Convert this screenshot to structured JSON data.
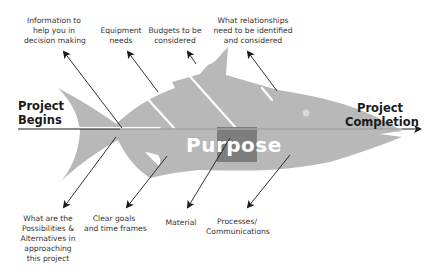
{
  "diagram": {
    "type": "fishbone",
    "center_label": "Purpose",
    "start": [
      "Project",
      "Begins"
    ],
    "end": [
      "Project",
      "Completion"
    ],
    "top_causes": [
      {
        "lines": [
          "Information to",
          "help you in",
          "decision making"
        ]
      },
      {
        "lines": [
          "Equipment",
          "needs"
        ]
      },
      {
        "lines": [
          "Budgets to be",
          "considered"
        ]
      },
      {
        "lines": [
          "What relationships",
          "need to be identified",
          "and considered"
        ]
      }
    ],
    "bottom_causes": [
      {
        "lines": [
          "What are the",
          "Possibilities &",
          "Alternatives in",
          "approaching",
          "this project"
        ]
      },
      {
        "lines": [
          "Clear goals",
          "and time frames"
        ]
      },
      {
        "lines": [
          "Material"
        ]
      },
      {
        "lines": [
          "Processes/",
          "Communications"
        ]
      }
    ],
    "colors": {
      "fish_body": "#b8b8b8",
      "purpose_box": "#7d7d7d",
      "arrow": "#1a1a1a",
      "text": "#333333"
    }
  }
}
